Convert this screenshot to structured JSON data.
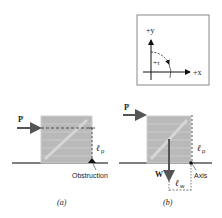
{
  "figure": {
    "inset": {
      "y_axis_label": "+y",
      "x_axis_label": "+x",
      "rotation_label": "+τ"
    },
    "panel_a": {
      "force_label": "P",
      "lever_arm_label": "ℓ",
      "lever_arm_subscript": "p",
      "pivot_label": "Obstruction",
      "caption": "(a)"
    },
    "panel_b": {
      "force_label": "P",
      "weight_label": "W",
      "lever_arm_p_label": "ℓ",
      "lever_arm_p_subscript": "p",
      "lever_arm_w_label": "ℓ",
      "lever_arm_w_subscript": "w",
      "pivot_label": "Axis",
      "caption": "(b)"
    },
    "colors": {
      "crate_fill": "#b9b9b9",
      "crate_plank": "#cfcfcf",
      "ground": "#555555",
      "arrow": "#555555",
      "text": "#222222"
    }
  }
}
